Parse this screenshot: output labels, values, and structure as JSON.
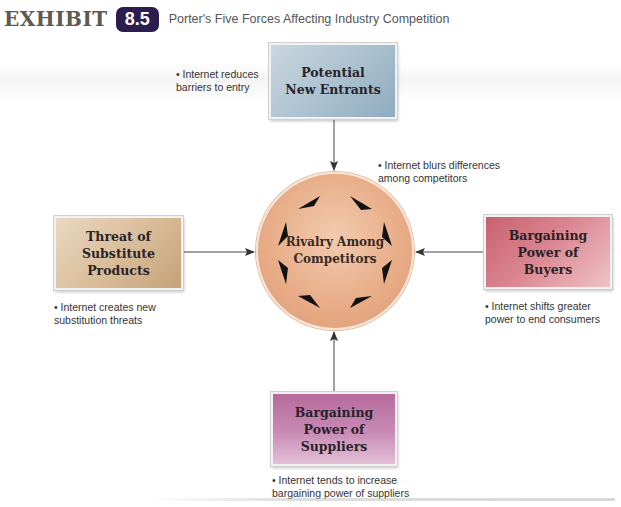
{
  "header": {
    "exhibit_label": "EXHIBIT",
    "exhibit_number": "8.5",
    "title": "Porter's Five Forces Affecting Industry Competition"
  },
  "center": {
    "label": "Rivalry Among\nCompetitors",
    "note": "• Internet blurs differences\n   among competitors",
    "color": "#e8ad88"
  },
  "forces": {
    "top": {
      "label": "Potential\nNew Entrants",
      "note": "• Internet reduces\n   barriers to entry",
      "color": "#a9c0cf"
    },
    "left": {
      "label": "Threat of\nSubstitute\nProducts",
      "note": "• Internet creates new\n   substitution threats",
      "color": "#d8bb97"
    },
    "right": {
      "label": "Bargaining\nPower of\nBuyers",
      "note": "• Internet shifts greater\n   power to end consumers",
      "color": "#d9848f"
    },
    "bottom": {
      "label": "Bargaining\nPower of\nSuppliers",
      "note": "• Internet tends to increase\n   bargaining power of suppliers",
      "color": "#c07aa8"
    }
  },
  "colors": {
    "badge": "#2b1e4e",
    "arrow": "#333333",
    "wedge": "#111111"
  }
}
